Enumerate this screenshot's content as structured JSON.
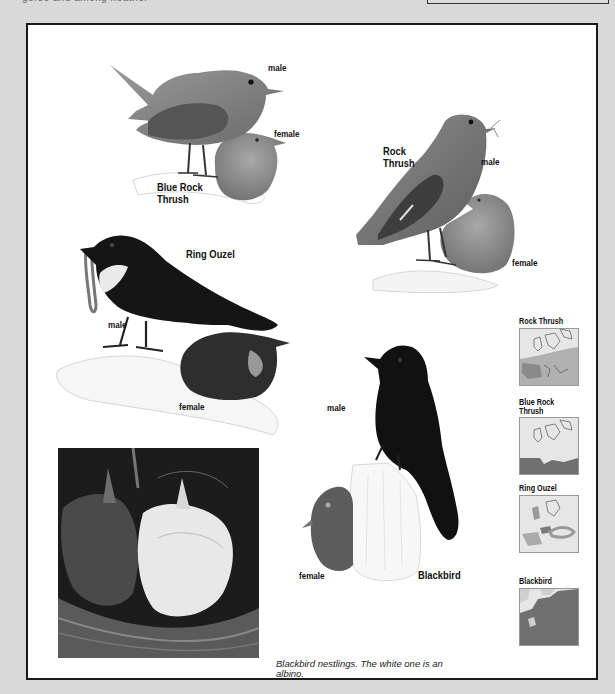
{
  "page": {
    "top_strip_text": "gorse and among heather",
    "colors": {
      "background": "#d9d9d9",
      "frame_border": "#1a1a1a",
      "page": "#ffffff",
      "range_light": "#a8a8a8",
      "range_dark": "#6e6e6e"
    }
  },
  "illustrations": {
    "blue_rock_thrush": {
      "name": "Blue Rock\nThrush",
      "name_line1": "Blue Rock",
      "name_line2": "Thrush",
      "male_label": "male",
      "female_label": "female"
    },
    "rock_thrush": {
      "name_line1": "Rock",
      "name_line2": "Thrush",
      "male_label": "male",
      "female_label": "female"
    },
    "ring_ouzel": {
      "name": "Ring Ouzel",
      "male_label": "male",
      "female_label": "female"
    },
    "blackbird": {
      "name": "Blackbird",
      "male_label": "male",
      "female_label": "female"
    }
  },
  "photo": {
    "subject": "blackbird-nestlings-photo",
    "caption": "Blackbird nestlings. The white one is an albino."
  },
  "range_maps": [
    {
      "title": "Rock Thrush",
      "shading": "southern-europe-light"
    },
    {
      "title_line1": "Blue Rock",
      "title_line2": "Thrush",
      "shading": "mediterranean-dark"
    },
    {
      "title": "Ring Ouzel",
      "shading": "mountains-light"
    },
    {
      "title": "Blackbird",
      "shading": "all-europe-dark"
    }
  ]
}
